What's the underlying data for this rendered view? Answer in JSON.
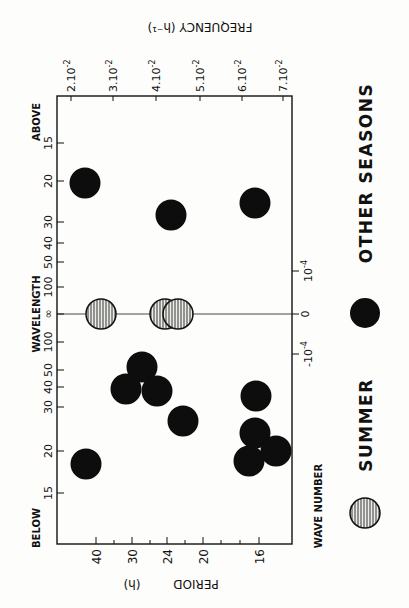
{
  "chart_data": {
    "type": "scatter",
    "orientation": "figure rotated 90 degrees counter-clockwise",
    "title": "",
    "xlabel": "PERIOD (h)",
    "x2label": "FREQUENCY (h-1)",
    "ylabel": "WAVELENGTH",
    "y2label": "WAVE NUMBER",
    "ylabel_top_end": "ABOVE",
    "ylabel_bottom_end": "BELOW",
    "period_ticks": [
      "40",
      "30",
      "24",
      "20",
      "16"
    ],
    "frequency_ticks": [
      "2.10-2",
      "3.10-2",
      "4.10-2",
      "5.10-2",
      "6.10-2",
      "7.10-2"
    ],
    "wavelength_ticks_above": [
      "15",
      "20",
      "30",
      "40",
      "50",
      "100"
    ],
    "wavelength_center": "∞",
    "wavelength_ticks_below": [
      "100",
      "50",
      "40",
      "30",
      "20",
      "15"
    ],
    "wavenumber_ticks": [
      "10-4",
      "0",
      "-10-4"
    ],
    "legend": [
      {
        "label": "SUMMER",
        "marker": "hatched-circle"
      },
      {
        "label": "OTHER SEASONS",
        "marker": "filled-circle"
      }
    ],
    "series": [
      {
        "name": "SUMMER",
        "points": [
          {
            "period_h": 36,
            "wavelength": "∞",
            "wavenumber": 0
          },
          {
            "period_h": 25,
            "wavelength": "∞",
            "wavenumber": 0
          },
          {
            "period_h": 23,
            "wavelength": "∞",
            "wavenumber": 0
          }
        ]
      },
      {
        "name": "OTHER SEASONS",
        "points": [
          {
            "period_h": 41,
            "wavelength": 20,
            "side": "above"
          },
          {
            "period_h": 25,
            "wavelength": 29,
            "side": "above"
          },
          {
            "period_h": 16,
            "wavelength": 27,
            "side": "above"
          },
          {
            "period_h": 27,
            "wavelength": 55,
            "side": "below"
          },
          {
            "period_h": 29,
            "wavelength": 42,
            "side": "below"
          },
          {
            "period_h": 25,
            "wavelength": 42,
            "side": "below"
          },
          {
            "period_h": 22,
            "wavelength": 31,
            "side": "below"
          },
          {
            "period_h": 16,
            "wavelength": 37,
            "side": "below"
          },
          {
            "period_h": 16,
            "wavelength": 23,
            "side": "below"
          },
          {
            "period_h": 17,
            "wavelength": 19,
            "side": "below"
          },
          {
            "period_h": 15,
            "wavelength": 20,
            "side": "below"
          },
          {
            "period_h": 41,
            "wavelength": 19,
            "side": "below"
          }
        ]
      }
    ],
    "grid": false
  },
  "labels": {
    "above": "ABOVE",
    "below": "BELOW",
    "wavelength": "WAVELENGTH",
    "wave_number": "WAVE NUMBER",
    "period": "PERIOD",
    "period_unit": "(h)",
    "frequency": "FREQUENCY (h⁻¹)",
    "summer": "SUMMER",
    "other_seasons": "OTHER SEASONS"
  },
  "ticks": {
    "left": [
      {
        "t": "15",
        "y": 143
      },
      {
        "t": "20",
        "y": 181
      },
      {
        "t": "30",
        "y": 222
      },
      {
        "t": "40",
        "y": 243
      },
      {
        "t": "50",
        "y": 262
      },
      {
        "t": "100",
        "y": 287
      },
      {
        "t": "∞",
        "y": 314
      },
      {
        "t": "100",
        "y": 342
      },
      {
        "t": "50",
        "y": 370
      },
      {
        "t": "40",
        "y": 387
      },
      {
        "t": "30",
        "y": 407
      },
      {
        "t": "20",
        "y": 451
      },
      {
        "t": "15",
        "y": 493
      }
    ],
    "bottom": [
      {
        "t": "40",
        "x": 96
      },
      {
        "t": "30",
        "x": 132
      },
      {
        "t": "24",
        "x": 167
      },
      {
        "t": "20",
        "x": 203
      },
      {
        "t": "16",
        "x": 259
      }
    ],
    "bottom_minor": [
      114,
      150,
      185,
      221,
      240
    ],
    "top": [
      {
        "t": "2.10",
        "x": 71
      },
      {
        "t": "3.10",
        "x": 113
      },
      {
        "t": "4.10",
        "x": 156
      },
      {
        "t": "5.10",
        "x": 200
      },
      {
        "t": "6.10",
        "x": 242
      },
      {
        "t": "7.10",
        "x": 283
      }
    ],
    "right": [
      {
        "t": "10",
        "sup": "-4",
        "y": 271
      },
      {
        "t": "0",
        "sup": "",
        "y": 314
      },
      {
        "t": "-10",
        "sup": "-4",
        "y": 354
      }
    ]
  },
  "markers": {
    "summer": [
      {
        "x": 101,
        "y": 314
      },
      {
        "x": 165,
        "y": 314
      },
      {
        "x": 178,
        "y": 314
      }
    ],
    "other": [
      {
        "x": 85,
        "y": 183
      },
      {
        "x": 171,
        "y": 215
      },
      {
        "x": 255,
        "y": 203
      },
      {
        "x": 142,
        "y": 367
      },
      {
        "x": 126,
        "y": 389
      },
      {
        "x": 157,
        "y": 391
      },
      {
        "x": 183,
        "y": 421
      },
      {
        "x": 256,
        "y": 396
      },
      {
        "x": 255,
        "y": 433
      },
      {
        "x": 249,
        "y": 461
      },
      {
        "x": 276,
        "y": 451
      },
      {
        "x": 86,
        "y": 464
      }
    ]
  },
  "colors": {
    "ink": "#111111",
    "paper": "#fdfdfb",
    "hatch_fill": "#e9e9e6"
  }
}
